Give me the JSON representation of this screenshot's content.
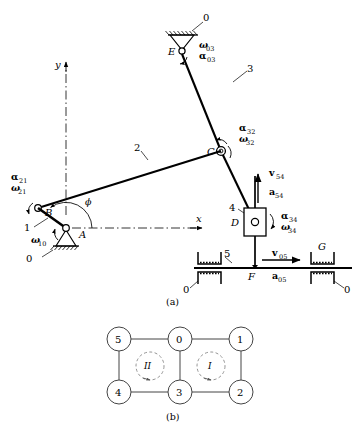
{
  "figure": {
    "caption_a": "(a)",
    "caption_b": "(b)"
  },
  "axes": {
    "y_label": "y",
    "x_label": "x"
  },
  "mechanism": {
    "joints": [
      {
        "id": "A",
        "label": "A",
        "x": 66,
        "y": 228,
        "type": "ground-pivot"
      },
      {
        "id": "B",
        "label": "B",
        "x": 38,
        "y": 208,
        "type": "pin"
      },
      {
        "id": "C",
        "label": "C",
        "x": 221,
        "y": 151,
        "type": "pin"
      },
      {
        "id": "D",
        "label": "D",
        "x": 255,
        "y": 222,
        "type": "slider-pin"
      },
      {
        "id": "E",
        "label": "E",
        "x": 182,
        "y": 51,
        "type": "ground-pivot"
      },
      {
        "id": "F",
        "label": "F",
        "x": 255,
        "y": 268,
        "type": "slider-point"
      },
      {
        "id": "G",
        "label": "G",
        "x": 323,
        "y": 254,
        "type": "guide"
      }
    ],
    "links": [
      {
        "label": "0",
        "x": 205,
        "y": 18
      },
      {
        "label": "3",
        "x": 249,
        "y": 72
      },
      {
        "label": "2",
        "x": 138,
        "y": 148
      },
      {
        "label": "1",
        "x": 26,
        "y": 228
      },
      {
        "label": "0",
        "x": 29,
        "y": 259
      },
      {
        "label": "4",
        "x": 232,
        "y": 208
      },
      {
        "label": "5",
        "x": 228,
        "y": 254
      },
      {
        "label": "0",
        "x": 200,
        "y": 283
      },
      {
        "label": "0",
        "x": 340,
        "y": 283
      }
    ],
    "angle_label": "ϕ",
    "kinematic_labels": [
      {
        "id": "omega03",
        "omega": "ω",
        "omega_sub": "03",
        "alpha": "α",
        "alpha_sub": "03",
        "x": 199,
        "y": 45
      },
      {
        "id": "alpha32",
        "alpha": "α",
        "alpha_sub": "32",
        "omega": "ω",
        "omega_sub": "32",
        "x": 240,
        "y": 128
      },
      {
        "id": "alpha21",
        "alpha": "α",
        "alpha_sub": "21",
        "omega": "ω",
        "omega_sub": "21",
        "x": 12,
        "y": 176
      },
      {
        "id": "omega10",
        "omega": "ω",
        "omega_sub": "10",
        "x": 33,
        "y": 235
      },
      {
        "id": "alpha34",
        "alpha": "α",
        "alpha_sub": "34",
        "omega": "ω",
        "omega_sub": "34",
        "x": 283,
        "y": 216
      }
    ],
    "vectors": [
      {
        "id": "v54",
        "symbol": "v",
        "sub": "54",
        "x": 272,
        "y": 173,
        "dir": "up"
      },
      {
        "id": "a54",
        "symbol": "a",
        "sub": "54",
        "x": 272,
        "y": 192,
        "dir": "up"
      },
      {
        "id": "v05",
        "symbol": "v",
        "sub": "05",
        "x": 277,
        "y": 254,
        "dir": "right"
      },
      {
        "id": "a05",
        "symbol": "a",
        "sub": "05",
        "x": 277,
        "y": 274,
        "dir": "right"
      }
    ]
  },
  "graph": {
    "nodes": [
      {
        "label": "5",
        "x": 119,
        "y": 339
      },
      {
        "label": "0",
        "x": 180,
        "y": 339
      },
      {
        "label": "1",
        "x": 241,
        "y": 339
      },
      {
        "label": "4",
        "x": 119,
        "y": 392
      },
      {
        "label": "3",
        "x": 180,
        "y": 392
      },
      {
        "label": "2",
        "x": 241,
        "y": 392
      }
    ],
    "edges": [
      {
        "from": "5",
        "to": "0"
      },
      {
        "from": "0",
        "to": "1"
      },
      {
        "from": "5",
        "to": "4"
      },
      {
        "from": "0",
        "to": "3"
      },
      {
        "from": "1",
        "to": "2"
      },
      {
        "from": "4",
        "to": "3"
      },
      {
        "from": "3",
        "to": "2"
      }
    ],
    "loops": [
      {
        "label": "II",
        "x": 149,
        "y": 366
      },
      {
        "label": "I",
        "x": 211,
        "y": 366
      }
    ]
  }
}
